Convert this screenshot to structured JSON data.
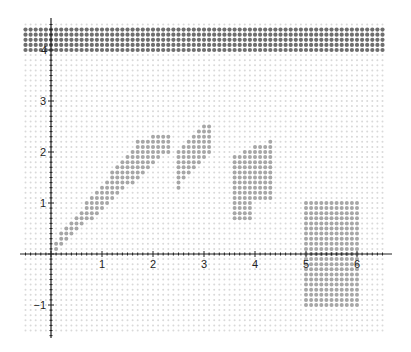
{
  "chart_data": {
    "type": "scatter",
    "title": "",
    "xlabel": "",
    "ylabel": "",
    "xlim": [
      -0.6,
      6.6
    ],
    "ylim": [
      -1.6,
      4.4
    ],
    "grid": "dotted lattice, spacing 0.1",
    "x_ticks": [
      "1",
      "2",
      "3",
      "4",
      "5",
      "6"
    ],
    "y_ticks": [
      "−1",
      "1",
      "2",
      "3",
      "4"
    ],
    "legend": "none",
    "colors": {
      "background_dot": "#d9d9d9",
      "region_dot": "#a6a6a6",
      "band_dot": "#6e6e6e",
      "axis": "#222222"
    },
    "regions": [
      {
        "name": "top-band",
        "shade": "dark",
        "x_range": [
          -0.55,
          6.55
        ],
        "y_range": [
          3.95,
          4.4
        ]
      },
      {
        "name": "diagonal-strip",
        "shade": "medium",
        "description": "thin diagonal strip from (0.1,0.1) to about (1.7,1.9)"
      },
      {
        "name": "parallelogram-1",
        "shade": "medium",
        "x_range": [
          1.3,
          2.3
        ],
        "y_range": [
          1.4,
          2.3
        ]
      },
      {
        "name": "parallelogram-2",
        "shade": "medium",
        "x_range": [
          2.5,
          3.1
        ],
        "y_range": [
          1.3,
          2.5
        ]
      },
      {
        "name": "block-3-4",
        "shade": "medium",
        "x_range": [
          3.6,
          4.3
        ],
        "y_range": [
          0.7,
          2.2
        ]
      },
      {
        "name": "rectangle-5-6",
        "shade": "medium",
        "x_range": [
          5.0,
          6.0
        ],
        "y_range": [
          -1.0,
          1.0
        ]
      }
    ]
  }
}
